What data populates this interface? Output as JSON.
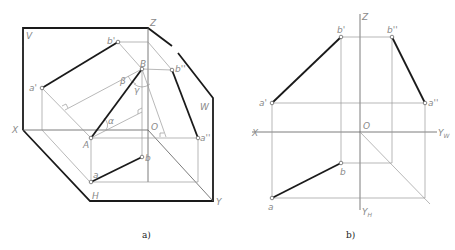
{
  "figure_a": {
    "caption": "a)",
    "labels": {
      "V": "V",
      "W": "W",
      "H": "H",
      "X": "X",
      "Y": "Y",
      "Z": "Z",
      "O": "O",
      "a_prime": "a'",
      "b_prime": "b'",
      "a_dprime": "a''",
      "b_dprime": "b''",
      "A": "A",
      "B": "B",
      "a": "a",
      "b": "b",
      "alpha": "α",
      "beta": "β",
      "gamma": "γ"
    }
  },
  "figure_b": {
    "caption": "b)",
    "labels": {
      "X": "X",
      "Z": "Z",
      "O": "O",
      "YW": "Y",
      "YW_sub": "W",
      "YH": "Y",
      "YH_sub": "H",
      "a_prime": "a'",
      "b_prime": "b'",
      "a_dprime": "a''",
      "b_dprime": "b''",
      "a": "a",
      "b": "b"
    }
  },
  "colors": {
    "bold_line": "#1a1a1a",
    "thin_line": "#9a9a9a",
    "label": "#8a8a8a"
  }
}
